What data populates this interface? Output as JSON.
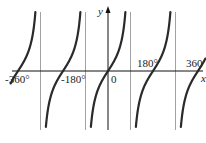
{
  "chart_data": {
    "type": "line",
    "title": "",
    "function": "y = tan x",
    "xlabel": "x",
    "ylabel": "y",
    "x_range_deg": [
      -390,
      390
    ],
    "tick_labels": [
      "-360°",
      "-180°",
      "0",
      "180°",
      "360"
    ],
    "tick_values_deg": [
      -360,
      -180,
      0,
      180,
      360
    ],
    "asymptotes_deg": [
      -270,
      -90,
      90,
      270
    ],
    "zeros_deg": [
      -360,
      -180,
      0,
      180,
      360
    ],
    "series": [
      {
        "name": "tan x",
        "x_deg": [
          -360,
          -315,
          -270,
          -225,
          -180,
          -135,
          -90,
          -45,
          0,
          45,
          90,
          135,
          180,
          225,
          270,
          315,
          360
        ],
        "values": [
          0,
          1,
          null,
          -1,
          0,
          1,
          null,
          -1,
          0,
          1,
          null,
          -1,
          0,
          1,
          null,
          -1,
          0
        ]
      }
    ],
    "grid": false,
    "legend": "none",
    "colors": {
      "curve": "#2a2a2a",
      "axis": "#111111",
      "asymptote": "#888888"
    }
  },
  "labels": {
    "y_axis": "y",
    "x_axis": "x",
    "t_m360": "-360°",
    "t_m180": "-180°",
    "t_0": "0",
    "t_180": "180°",
    "t_360": "360"
  }
}
